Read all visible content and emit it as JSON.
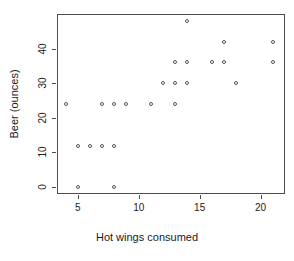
{
  "chart_data": {
    "type": "scatter",
    "title": "",
    "xlabel": "Hot wings consumed",
    "ylabel": "Beer (ounces)",
    "xlim": [
      3.3,
      22.0
    ],
    "ylim": [
      -2.0,
      50.0
    ],
    "xticks": [
      5,
      10,
      15,
      20
    ],
    "yticks": [
      0,
      10,
      20,
      30,
      40
    ],
    "xtick_labels": [
      "5",
      "10",
      "15",
      "20"
    ],
    "ytick_labels": [
      "0",
      "10",
      "20",
      "30",
      "40"
    ],
    "grid": false,
    "legend": null,
    "marker": "open-circle",
    "marker_color": "#555555",
    "point_count": 24,
    "points": [
      {
        "x": 4,
        "y": 24
      },
      {
        "x": 5,
        "y": 0
      },
      {
        "x": 5,
        "y": 12
      },
      {
        "x": 6,
        "y": 12
      },
      {
        "x": 7,
        "y": 12
      },
      {
        "x": 7,
        "y": 24
      },
      {
        "x": 8,
        "y": 0
      },
      {
        "x": 8,
        "y": 12
      },
      {
        "x": 8,
        "y": 24
      },
      {
        "x": 9,
        "y": 24
      },
      {
        "x": 11,
        "y": 24
      },
      {
        "x": 12,
        "y": 30
      },
      {
        "x": 13,
        "y": 24
      },
      {
        "x": 13,
        "y": 30
      },
      {
        "x": 13,
        "y": 36
      },
      {
        "x": 14,
        "y": 30
      },
      {
        "x": 14,
        "y": 36
      },
      {
        "x": 14,
        "y": 48
      },
      {
        "x": 16,
        "y": 36
      },
      {
        "x": 17,
        "y": 36
      },
      {
        "x": 17,
        "y": 42
      },
      {
        "x": 18,
        "y": 30
      },
      {
        "x": 21,
        "y": 36
      },
      {
        "x": 21,
        "y": 42
      }
    ]
  },
  "axes": {
    "panel": {
      "left": 57,
      "top": 14,
      "width": 228,
      "height": 180
    },
    "colors": {
      "axis": "#4d4d4d",
      "text": "#1a1a1a",
      "marker": "#555555",
      "background": "#ffffff"
    }
  }
}
